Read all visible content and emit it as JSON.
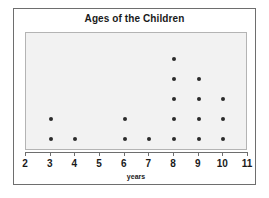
{
  "chart_data": {
    "type": "scatter",
    "plot_style": "dot-plot",
    "title": "Ages of the Children",
    "xlabel": "years",
    "ylabel": "",
    "xlim": [
      2,
      11
    ],
    "ylim": [
      0,
      6
    ],
    "grid": false,
    "legend": null,
    "x_ticks": [
      2,
      3,
      4,
      5,
      6,
      7,
      8,
      9,
      10,
      11
    ],
    "x_tick_labels": [
      "2",
      "3",
      "4",
      "5",
      "6",
      "7",
      "8",
      "9",
      "10",
      "11"
    ],
    "y_axis_visible": false,
    "categories": [
      2,
      3,
      4,
      5,
      6,
      7,
      8,
      9,
      10,
      11
    ],
    "values": [
      0,
      2,
      1,
      0,
      2,
      1,
      5,
      4,
      3,
      0
    ],
    "counts_by_age": [
      {
        "age": 2,
        "count": 0
      },
      {
        "age": 3,
        "count": 2
      },
      {
        "age": 4,
        "count": 1
      },
      {
        "age": 5,
        "count": 0
      },
      {
        "age": 6,
        "count": 2
      },
      {
        "age": 7,
        "count": 1
      },
      {
        "age": 8,
        "count": 5
      },
      {
        "age": 9,
        "count": 4
      },
      {
        "age": 10,
        "count": 3
      },
      {
        "age": 11,
        "count": 0
      }
    ],
    "total_dots": 18,
    "colors": {
      "dot": "#2b2b2b",
      "panel_background": "#f2f2f2",
      "panel_border": "#b4b4b4",
      "axis": "#6e6e6e",
      "frame": "#6e6e6e",
      "text": "#1a1a1a",
      "figure_background": "#ffffff"
    }
  }
}
